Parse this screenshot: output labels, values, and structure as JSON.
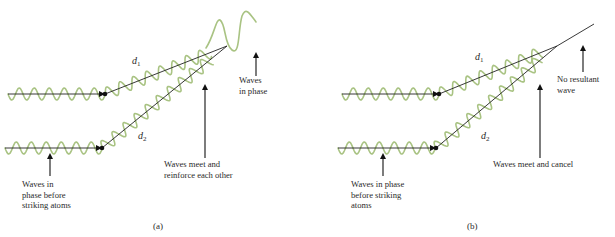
{
  "colors": {
    "wave": "#a9c383",
    "line": "#222222",
    "text": "#2a2a2a"
  },
  "panels": [
    {
      "id": "a",
      "caption": "(a)",
      "caption_pos": [
        153,
        229
      ],
      "beam1": {
        "start": [
          8,
          94
        ],
        "dot": [
          105,
          94
        ],
        "end": [
          227,
          46
        ],
        "wave_start_x": 8,
        "amp": 6,
        "wavelength": 15
      },
      "beam2": {
        "start": [
          5,
          148
        ],
        "dot": [
          102,
          148
        ],
        "end": [
          227,
          46
        ],
        "wave_start_x": 5,
        "amp": 6,
        "wavelength": 15
      },
      "d1": {
        "text": "d",
        "sub": "1",
        "pos": [
          132,
          64
        ]
      },
      "d2": {
        "text": "d",
        "sub": "2",
        "pos": [
          138,
          139
        ]
      },
      "result_wave": true,
      "labels": {
        "incoming": [
          "Waves in",
          "phase before",
          "striking atoms"
        ],
        "incoming_pos": [
          22,
          187
        ],
        "incoming_arrow": {
          "x": 50,
          "y1": 176,
          "y2": 152
        },
        "meet": [
          "Waves meet and",
          "reinforce each other"
        ],
        "meet_pos": [
          164,
          167
        ],
        "meet_arrow": {
          "x": 205,
          "y1": 158,
          "y2": 83
        },
        "result": [
          "Waves",
          "in phase"
        ],
        "result_pos": [
          239,
          83
        ],
        "result_arrow": {
          "x": 256,
          "y1": 76,
          "y2": 51
        }
      }
    },
    {
      "id": "b",
      "caption": "(b)",
      "caption_pos": [
        467,
        229
      ],
      "beam1": {
        "start": [
          342,
          94
        ],
        "dot": [
          439,
          94
        ],
        "end": [
          557,
          46
        ],
        "wave_start_x": 342,
        "amp": 6,
        "wavelength": 15
      },
      "beam2": {
        "start": [
          338,
          148
        ],
        "dot": [
          436,
          148
        ],
        "end": [
          557,
          46
        ],
        "wave_start_x": 338,
        "amp": 6,
        "wavelength": 15
      },
      "d1": {
        "text": "d",
        "sub": "1",
        "pos": [
          475,
          60
        ]
      },
      "d2": {
        "text": "d",
        "sub": "2",
        "pos": [
          481,
          139
        ]
      },
      "result_wave": false,
      "result_line_end": [
        594,
        24
      ],
      "labels": {
        "incoming": [
          "Waves in phase",
          "before striking",
          "atoms"
        ],
        "incoming_pos": [
          351,
          187
        ],
        "incoming_arrow": {
          "x": 383,
          "y1": 176,
          "y2": 152
        },
        "meet": [
          "Waves meet and cancel"
        ],
        "meet_pos": [
          493,
          167
        ],
        "meet_arrow": {
          "x": 540,
          "y1": 158,
          "y2": 83
        },
        "result": [
          "No resultant",
          "wave"
        ],
        "result_pos": [
          557,
          82
        ],
        "result_arrow": {
          "x": 583,
          "y1": 72,
          "y2": 44
        }
      }
    }
  ]
}
